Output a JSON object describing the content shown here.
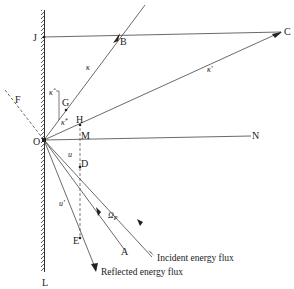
{
  "diagram": {
    "type": "ray-reflection geometry",
    "colors": {
      "line": "#333333",
      "text": "#222222",
      "background": "#ffffff"
    },
    "points": {
      "J": "J",
      "B": "B",
      "C": "C",
      "F": "F",
      "G": "G",
      "H": "H",
      "M": "M",
      "N": "N",
      "O": "O",
      "D": "D",
      "E": "E",
      "A": "A",
      "L": "L"
    },
    "symbols": {
      "kappa": "κ",
      "kappa_prime": "κ'",
      "kappa_hat": "κ̂",
      "kappa_hat_prime": "κ̂'",
      "u": "u",
      "u_prime": "u'",
      "omega_p": "Ω",
      "omega_p_sub": "P"
    },
    "captions": {
      "incident": "Incident energy flux",
      "reflected": "Reflected energy flux"
    }
  }
}
